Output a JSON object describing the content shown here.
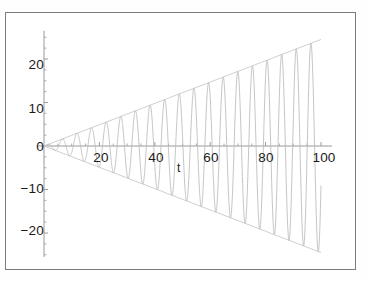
{
  "figure": {
    "background_color": "#ffffff",
    "frame_color": "#7a7d80",
    "curve_color": "#b9b9b9",
    "envelope_color": "#c9c9c9",
    "axis_color": "#9a9a9a",
    "text_color": "#1b1b1b"
  },
  "chart_data": {
    "type": "line",
    "title": "",
    "subtitle": "",
    "xlabel": "t",
    "ylabel": "",
    "xlim": [
      -3,
      107
    ],
    "ylim": [
      -27,
      27
    ],
    "grid": false,
    "legend": null,
    "x_ticks": [
      20,
      40,
      60,
      80,
      100
    ],
    "x_tick_labels": [
      "20",
      "40",
      "60",
      "80",
      "100"
    ],
    "y_ticks": [
      -20,
      -10,
      0,
      10,
      20
    ],
    "y_tick_labels": [
      "−20",
      "−10",
      "0",
      "10",
      "20"
    ],
    "minor_ticks": true,
    "annotations": [
      {
        "text": "t",
        "x": 50,
        "y": -4.5
      }
    ],
    "series": [
      {
        "name": "x(t)",
        "equation": "x(t) = 0.245 * t * sin(1.19 * t)",
        "envelope_upper": "0.245 * t",
        "envelope_lower": "-0.245 * t",
        "amplitude_slope": 0.245,
        "angular_frequency": 1.19,
        "cycles": 19,
        "t_start": 0,
        "t_end": 100,
        "samples": 2400,
        "peak_value_at_end": 24.5,
        "trough_value_at_end": -24.5
      }
    ]
  }
}
